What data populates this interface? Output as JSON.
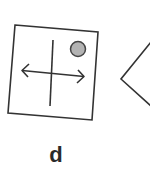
{
  "figure": {
    "label": "d",
    "panel": {
      "shape": "square",
      "rotation_deg": 5,
      "border_color": "#333333",
      "contents": [
        {
          "type": "vertical-line"
        },
        {
          "type": "double-headed-arrow",
          "orientation": "horizontal"
        },
        {
          "type": "circle",
          "fill": "#b3b3b3",
          "position": "top-right"
        }
      ]
    },
    "partial_shape": {
      "type": "chevron-left",
      "note": "cropped at right edge"
    }
  },
  "colors": {
    "stroke": "#333333",
    "circle_fill": "#b3b3b3",
    "background": "#ffffff"
  }
}
